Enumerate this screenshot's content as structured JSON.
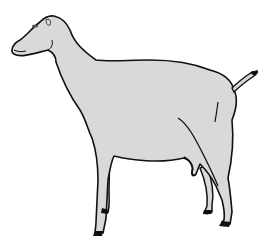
{
  "image": {
    "subject": "goat illustration",
    "description": "Line drawing of a hornless goat standing in side profile facing left, light gray fill with black outline",
    "colors": {
      "background": "#ffffff",
      "body_fill": "#d9d9d9",
      "outline": "#111111",
      "hooves": "#111111"
    }
  }
}
